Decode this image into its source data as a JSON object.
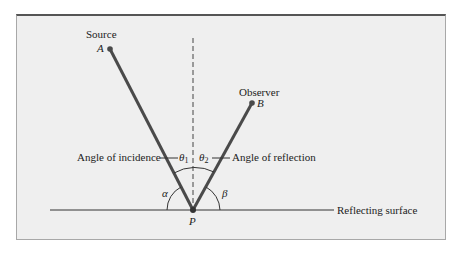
{
  "diagram": {
    "source_label": "Source",
    "point_a": "A",
    "observer_label": "Observer",
    "point_b": "B",
    "point_p": "P",
    "angle_incidence_label": "Angle of incidence",
    "angle_reflection_label": "Angle of reflection",
    "theta1": "θ",
    "theta1_sub": "1",
    "theta2": "θ",
    "theta2_sub": "2",
    "alpha": "α",
    "beta": "β",
    "surface_label": "Reflecting surface"
  },
  "colors": {
    "background": "#efefef",
    "ray": "#4a4a4a",
    "line": "#333333"
  }
}
